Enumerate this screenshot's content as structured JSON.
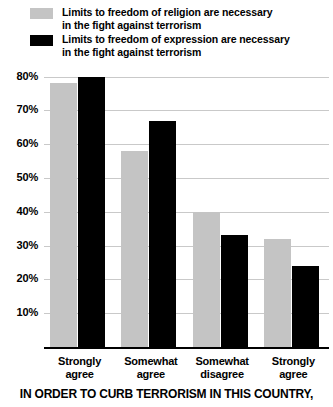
{
  "legend": {
    "items": [
      {
        "label": "Limits to freedom of religion are necessary\nin the fight against terrorism",
        "color": "#c4c4c4",
        "swatch_name": "religion-swatch"
      },
      {
        "label": "Limits to freedom of expression are necessary\nin the fight against terrorism",
        "color": "#000000",
        "swatch_name": "expression-swatch"
      }
    ]
  },
  "bottom_title": "IN ORDER TO CURB TERRORISM IN THIS COUNTRY,",
  "axis": {
    "yticks": [
      "80%",
      "70%",
      "60%",
      "50%",
      "40%",
      "30%",
      "20%",
      "10%"
    ],
    "ytick_values": [
      80,
      70,
      60,
      50,
      40,
      30,
      20,
      10
    ]
  },
  "chart_data": {
    "type": "bar",
    "title": "",
    "subtitle": "",
    "xlabel": "IN ORDER TO CURB TERRORISM IN THIS COUNTRY,",
    "ylabel": "",
    "categories": [
      "Strongly\nagree",
      "Somewhat\nagree",
      "Somewhat\ndisagree",
      "Strongly\nagree"
    ],
    "series": [
      {
        "name": "Limits to freedom of religion are necessary in the fight against terrorism",
        "color": "#c4c4c4",
        "values": [
          78,
          58,
          40,
          32
        ]
      },
      {
        "name": "Limits to freedom of expression are necessary in the fight against terrorism",
        "color": "#000000",
        "values": [
          80,
          67,
          33,
          24
        ]
      }
    ],
    "ylim": [
      0,
      85
    ],
    "ytick_step": 10,
    "grid": true,
    "legend_position": "top-left",
    "value_format": "percent"
  }
}
